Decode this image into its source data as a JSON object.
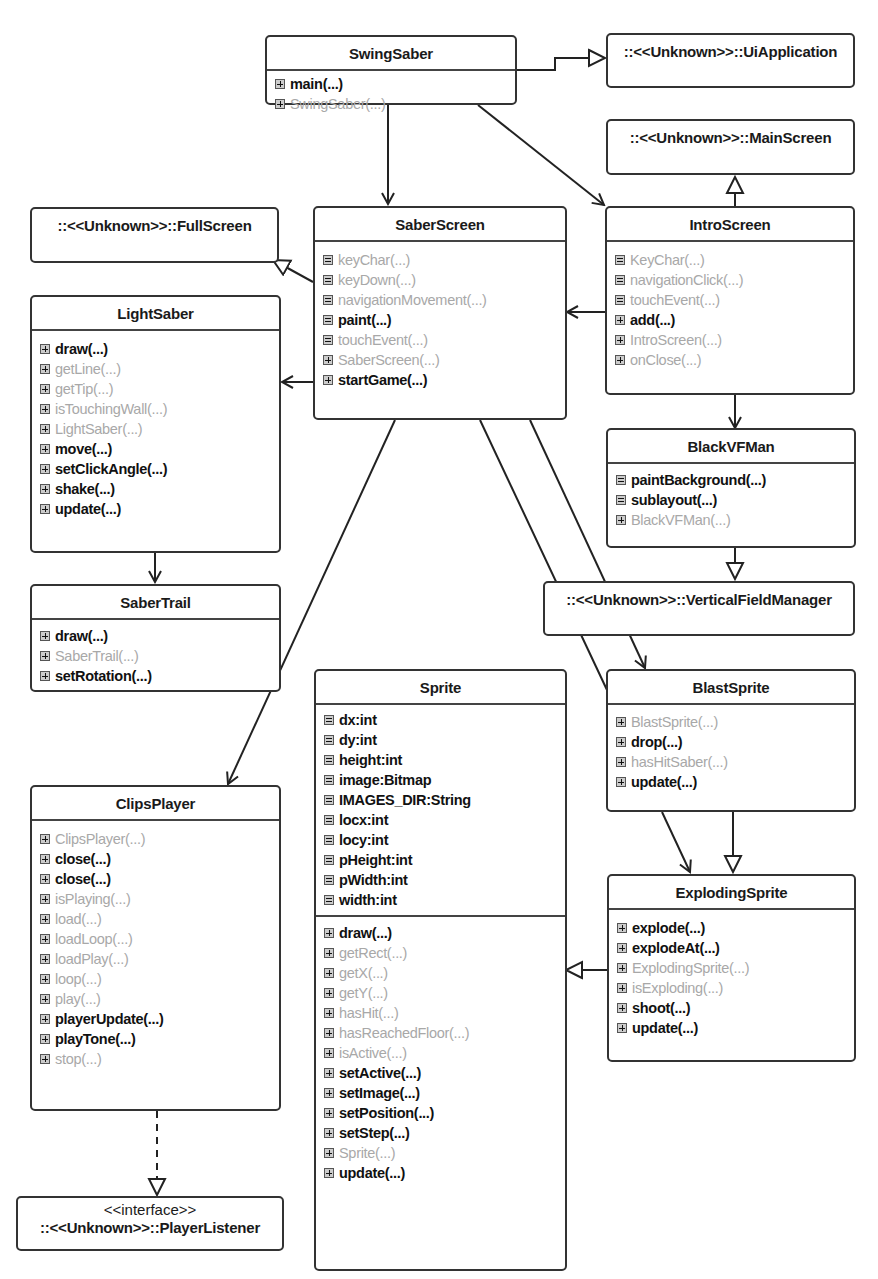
{
  "diagram": {
    "type": "UML class diagram",
    "classes": {
      "swingsaber": {
        "name": "SwingSaber",
        "methods": [
          {
            "label": "main(...)",
            "visibility": "public",
            "icon": "plus"
          },
          {
            "label": "SwingSaber(...)",
            "visibility": "private",
            "icon": "plus"
          }
        ]
      },
      "saberscreen": {
        "name": "SaberScreen",
        "methods": [
          {
            "label": "keyChar(...)",
            "visibility": "private",
            "icon": "grid"
          },
          {
            "label": "keyDown(...)",
            "visibility": "private",
            "icon": "grid"
          },
          {
            "label": "navigationMovement(...)",
            "visibility": "private",
            "icon": "grid"
          },
          {
            "label": "paint(...)",
            "visibility": "public",
            "icon": "grid"
          },
          {
            "label": "touchEvent(...)",
            "visibility": "private",
            "icon": "grid"
          },
          {
            "label": "SaberScreen(...)",
            "visibility": "private",
            "icon": "plus"
          },
          {
            "label": "startGame(...)",
            "visibility": "public",
            "icon": "plus"
          }
        ]
      },
      "introscreen": {
        "name": "IntroScreen",
        "methods": [
          {
            "label": "KeyChar(...)",
            "visibility": "private",
            "icon": "grid"
          },
          {
            "label": "navigationClick(...)",
            "visibility": "private",
            "icon": "grid"
          },
          {
            "label": "touchEvent(...)",
            "visibility": "private",
            "icon": "grid"
          },
          {
            "label": "add(...)",
            "visibility": "public",
            "icon": "plus"
          },
          {
            "label": "IntroScreen(...)",
            "visibility": "private",
            "icon": "plus"
          },
          {
            "label": "onClose(...)",
            "visibility": "private",
            "icon": "plus"
          }
        ]
      },
      "lightsaber": {
        "name": "LightSaber",
        "methods": [
          {
            "label": "draw(...)",
            "visibility": "public",
            "icon": "plus"
          },
          {
            "label": "getLine(...)",
            "visibility": "private",
            "icon": "plus"
          },
          {
            "label": "getTip(...)",
            "visibility": "private",
            "icon": "plus"
          },
          {
            "label": "isTouchingWall(...)",
            "visibility": "private",
            "icon": "plus"
          },
          {
            "label": "LightSaber(...)",
            "visibility": "private",
            "icon": "plus"
          },
          {
            "label": "move(...)",
            "visibility": "public",
            "icon": "plus"
          },
          {
            "label": "setClickAngle(...)",
            "visibility": "public",
            "icon": "plus"
          },
          {
            "label": "shake(...)",
            "visibility": "public",
            "icon": "plus"
          },
          {
            "label": "update(...)",
            "visibility": "public",
            "icon": "plus"
          }
        ]
      },
      "blackvfman": {
        "name": "BlackVFMan",
        "methods": [
          {
            "label": "paintBackground(...)",
            "visibility": "public",
            "icon": "grid"
          },
          {
            "label": "sublayout(...)",
            "visibility": "public",
            "icon": "grid"
          },
          {
            "label": "BlackVFMan(...)",
            "visibility": "private",
            "icon": "plus"
          }
        ]
      },
      "sabertrail": {
        "name": "SaberTrail",
        "methods": [
          {
            "label": "draw(...)",
            "visibility": "public",
            "icon": "plus"
          },
          {
            "label": "SaberTrail(...)",
            "visibility": "private",
            "icon": "plus"
          },
          {
            "label": "setRotation(...)",
            "visibility": "public",
            "icon": "plus"
          }
        ]
      },
      "sprite": {
        "name": "Sprite",
        "attributes": [
          {
            "label": "dx:int",
            "visibility": "public",
            "icon": "grid"
          },
          {
            "label": "dy:int",
            "visibility": "public",
            "icon": "grid"
          },
          {
            "label": "height:int",
            "visibility": "public",
            "icon": "grid"
          },
          {
            "label": "image:Bitmap",
            "visibility": "public",
            "icon": "grid"
          },
          {
            "label": "IMAGES_DIR:String",
            "visibility": "public",
            "icon": "grid"
          },
          {
            "label": "locx:int",
            "visibility": "public",
            "icon": "grid"
          },
          {
            "label": "locy:int",
            "visibility": "public",
            "icon": "grid"
          },
          {
            "label": "pHeight:int",
            "visibility": "public",
            "icon": "grid"
          },
          {
            "label": "pWidth:int",
            "visibility": "public",
            "icon": "grid"
          },
          {
            "label": "width:int",
            "visibility": "public",
            "icon": "grid"
          }
        ],
        "methods": [
          {
            "label": "draw(...)",
            "visibility": "public",
            "icon": "plus"
          },
          {
            "label": "getRect(...)",
            "visibility": "private",
            "icon": "plus"
          },
          {
            "label": "getX(...)",
            "visibility": "private",
            "icon": "plus"
          },
          {
            "label": "getY(...)",
            "visibility": "private",
            "icon": "plus"
          },
          {
            "label": "hasHit(...)",
            "visibility": "private",
            "icon": "plus"
          },
          {
            "label": "hasReachedFloor(...)",
            "visibility": "private",
            "icon": "plus"
          },
          {
            "label": "isActive(...)",
            "visibility": "private",
            "icon": "plus"
          },
          {
            "label": "setActive(...)",
            "visibility": "public",
            "icon": "plus"
          },
          {
            "label": "setImage(...)",
            "visibility": "public",
            "icon": "plus"
          },
          {
            "label": "setPosition(...)",
            "visibility": "public",
            "icon": "plus"
          },
          {
            "label": "setStep(...)",
            "visibility": "public",
            "icon": "plus"
          },
          {
            "label": "Sprite(...)",
            "visibility": "private",
            "icon": "plus"
          },
          {
            "label": "update(...)",
            "visibility": "public",
            "icon": "plus"
          }
        ]
      },
      "blastsprite": {
        "name": "BlastSprite",
        "methods": [
          {
            "label": "BlastSprite(...)",
            "visibility": "private",
            "icon": "plus"
          },
          {
            "label": "drop(...)",
            "visibility": "public",
            "icon": "plus"
          },
          {
            "label": "hasHitSaber(...)",
            "visibility": "private",
            "icon": "plus"
          },
          {
            "label": "update(...)",
            "visibility": "public",
            "icon": "plus"
          }
        ]
      },
      "clipsplayer": {
        "name": "ClipsPlayer",
        "methods": [
          {
            "label": "ClipsPlayer(...)",
            "visibility": "private",
            "icon": "plus"
          },
          {
            "label": "close(...)",
            "visibility": "public",
            "icon": "plus"
          },
          {
            "label": "close(...)",
            "visibility": "public",
            "icon": "plus"
          },
          {
            "label": "isPlaying(...)",
            "visibility": "private",
            "icon": "plus"
          },
          {
            "label": "load(...)",
            "visibility": "private",
            "icon": "plus"
          },
          {
            "label": "loadLoop(...)",
            "visibility": "private",
            "icon": "plus"
          },
          {
            "label": "loadPlay(...)",
            "visibility": "private",
            "icon": "plus"
          },
          {
            "label": "loop(...)",
            "visibility": "private",
            "icon": "plus"
          },
          {
            "label": "play(...)",
            "visibility": "private",
            "icon": "plus"
          },
          {
            "label": "playerUpdate(...)",
            "visibility": "public",
            "icon": "plus"
          },
          {
            "label": "playTone(...)",
            "visibility": "public",
            "icon": "plus"
          },
          {
            "label": "stop(...)",
            "visibility": "private",
            "icon": "plus"
          }
        ]
      },
      "explodingsprite": {
        "name": "ExplodingSprite",
        "methods": [
          {
            "label": "explode(...)",
            "visibility": "public",
            "icon": "plus"
          },
          {
            "label": "explodeAt(...)",
            "visibility": "public",
            "icon": "plus"
          },
          {
            "label": "ExplodingSprite(...)",
            "visibility": "private",
            "icon": "plus"
          },
          {
            "label": "isExploding(...)",
            "visibility": "private",
            "icon": "plus"
          },
          {
            "label": "shoot(...)",
            "visibility": "public",
            "icon": "plus"
          },
          {
            "label": "update(...)",
            "visibility": "public",
            "icon": "plus"
          }
        ]
      }
    },
    "external": {
      "uiapplication": "::<<Unknown>>::UiApplication",
      "mainscreen": "::<<Unknown>>::MainScreen",
      "fullscreen": "::<<Unknown>>::FullScreen",
      "verticalfieldmanager": "::<<Unknown>>::VerticalFieldManager",
      "playerlistener": {
        "stereotype": "<<interface>>",
        "name": "::<<Unknown>>::PlayerListener"
      }
    },
    "relationships": [
      {
        "from": "SwingSaber",
        "to": "UiApplication",
        "kind": "generalization"
      },
      {
        "from": "SwingSaber",
        "to": "SaberScreen",
        "kind": "association"
      },
      {
        "from": "SwingSaber",
        "to": "IntroScreen",
        "kind": "association"
      },
      {
        "from": "IntroScreen",
        "to": "MainScreen",
        "kind": "generalization"
      },
      {
        "from": "SaberScreen",
        "to": "FullScreen",
        "kind": "generalization"
      },
      {
        "from": "IntroScreen",
        "to": "SaberScreen",
        "kind": "association"
      },
      {
        "from": "SaberScreen",
        "to": "LightSaber",
        "kind": "association"
      },
      {
        "from": "IntroScreen",
        "to": "BlackVFMan",
        "kind": "association"
      },
      {
        "from": "BlackVFMan",
        "to": "VerticalFieldManager",
        "kind": "generalization"
      },
      {
        "from": "LightSaber",
        "to": "SaberTrail",
        "kind": "association"
      },
      {
        "from": "SaberScreen",
        "to": "ClipsPlayer",
        "kind": "association"
      },
      {
        "from": "SaberScreen",
        "to": "BlastSprite",
        "kind": "association"
      },
      {
        "from": "SaberScreen",
        "to": "ExplodingSprite",
        "kind": "association"
      },
      {
        "from": "BlastSprite",
        "to": "ExplodingSprite",
        "kind": "association"
      },
      {
        "from": "BlastSprite",
        "to": "ExplodingSprite",
        "kind": "generalization"
      },
      {
        "from": "ExplodingSprite",
        "to": "Sprite",
        "kind": "generalization"
      },
      {
        "from": "ClipsPlayer",
        "to": "PlayerListener",
        "kind": "realization"
      }
    ]
  }
}
